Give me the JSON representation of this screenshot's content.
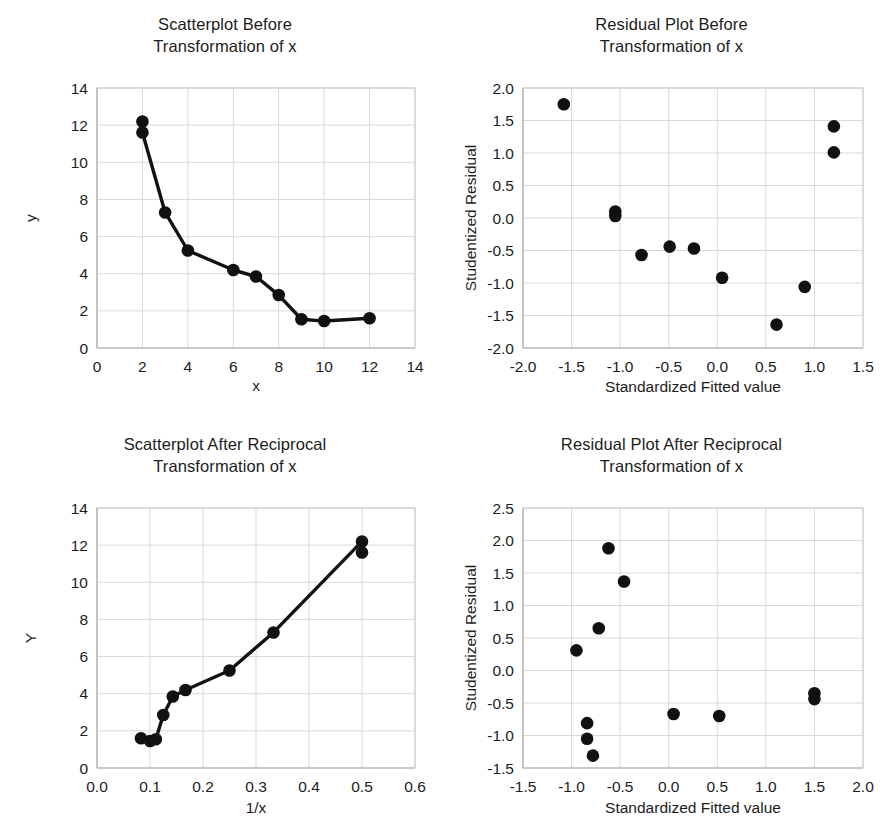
{
  "figure": {
    "panel_count": 4,
    "background": "#ffffff",
    "marker_color": "#111111",
    "gridline_color": "#d9d9d9"
  },
  "chart_data": [
    {
      "id": "scatterplot-before",
      "type": "line",
      "title": "Scatterplot Before Transformation of x",
      "title_line1": "Scatterplot Before",
      "title_line2": "Transformation of x",
      "xlabel": "x",
      "ylabel": "y",
      "xlim": [
        0,
        14
      ],
      "ylim": [
        0,
        14
      ],
      "xticks": [
        0,
        2,
        4,
        6,
        8,
        10,
        12,
        14
      ],
      "yticks": [
        0,
        2,
        4,
        6,
        8,
        10,
        12,
        14
      ],
      "xticklabels": [
        "0",
        "2",
        "4",
        "6",
        "8",
        "10",
        "12",
        "14"
      ],
      "yticklabels": [
        "0",
        "2",
        "4",
        "6",
        "8",
        "10",
        "12",
        "14"
      ],
      "grid": true,
      "legend": "none",
      "markers": true,
      "connected": true,
      "x": [
        2.0,
        2.0,
        3.0,
        4.0,
        6.0,
        7.0,
        8.0,
        9.0,
        10.0,
        12.0
      ],
      "y": [
        12.2,
        11.6,
        7.3,
        5.25,
        4.2,
        3.85,
        2.85,
        1.55,
        1.45,
        1.6
      ]
    },
    {
      "id": "residual-plot-before",
      "type": "scatter",
      "title": "Residual Plot Before Transformation of x",
      "title_line1": "Residual Plot Before",
      "title_line2": "Transformation of x",
      "xlabel": "Standardized Fitted value",
      "ylabel": "Studentized Residual",
      "xlim": [
        -2.0,
        1.5
      ],
      "ylim": [
        -2.0,
        2.0
      ],
      "xticks": [
        -2.0,
        -1.5,
        -1.0,
        -0.5,
        0.0,
        0.5,
        1.0,
        1.5
      ],
      "yticks": [
        -2.0,
        -1.5,
        -1.0,
        -0.5,
        0.0,
        0.5,
        1.0,
        1.5,
        2.0
      ],
      "xticklabels": [
        "-2.0",
        "-1.5",
        "-1.0",
        "-0.5",
        "0.0",
        "0.5",
        "1.0",
        "1.5"
      ],
      "yticklabels": [
        "-2.0",
        "-1.5",
        "-1.0",
        "-0.5",
        "0.0",
        "0.5",
        "1.0",
        "1.5",
        "2.0"
      ],
      "grid": true,
      "legend": "none",
      "markers": true,
      "connected": false,
      "x": [
        -1.58,
        -1.05,
        -1.05,
        -0.78,
        -0.49,
        -0.24,
        0.05,
        0.61,
        0.9,
        1.2,
        1.2
      ],
      "y": [
        1.75,
        0.1,
        0.03,
        -0.57,
        -0.44,
        -0.47,
        -0.92,
        -1.64,
        -1.06,
        1.41,
        1.01
      ]
    },
    {
      "id": "scatterplot-after",
      "type": "line",
      "title": "Scatterplot After Reciprocal Transformation of x",
      "title_line1": "Scatterplot After Reciprocal",
      "title_line2": "Transformation of x",
      "xlabel": "1/x",
      "ylabel": "Y",
      "xlim": [
        0.0,
        0.6
      ],
      "ylim": [
        0,
        14
      ],
      "xticks": [
        0.0,
        0.1,
        0.2,
        0.3,
        0.4,
        0.5,
        0.6
      ],
      "yticks": [
        0,
        2,
        4,
        6,
        8,
        10,
        12,
        14
      ],
      "xticklabels": [
        "0.0",
        "0.1",
        "0.2",
        "0.3",
        "0.4",
        "0.5",
        "0.6"
      ],
      "yticklabels": [
        "0",
        "2",
        "4",
        "6",
        "8",
        "10",
        "12",
        "14"
      ],
      "grid": true,
      "legend": "none",
      "markers": true,
      "connected": true,
      "x": [
        0.083,
        0.1,
        0.111,
        0.125,
        0.143,
        0.167,
        0.25,
        0.333,
        0.5,
        0.5
      ],
      "y": [
        1.6,
        1.45,
        1.55,
        2.85,
        3.85,
        4.2,
        5.25,
        7.3,
        12.2,
        11.6
      ]
    },
    {
      "id": "residual-plot-after",
      "type": "scatter",
      "title": "Residual Plot After Reciprocal Transformation of x",
      "title_line1": "Residual Plot After Reciprocal",
      "title_line2": "Transformation of x",
      "xlabel": "Standardized Fitted value",
      "ylabel": "Studentized Residual",
      "xlim": [
        -1.5,
        2.0
      ],
      "ylim": [
        -1.5,
        2.5
      ],
      "xticks": [
        -1.5,
        -1.0,
        -0.5,
        0.0,
        0.5,
        1.0,
        1.5,
        2.0
      ],
      "yticks": [
        -1.5,
        -1.0,
        -0.5,
        0.0,
        0.5,
        1.0,
        1.5,
        2.0,
        2.5
      ],
      "xticklabels": [
        "-1.5",
        "-1.0",
        "-0.5",
        "0.0",
        "0.5",
        "1.0",
        "1.5",
        "2.0"
      ],
      "yticklabels": [
        "-1.5",
        "-1.0",
        "-0.5",
        "0.0",
        "0.5",
        "1.0",
        "1.5",
        "2.0",
        "2.5"
      ],
      "grid": true,
      "legend": "none",
      "markers": true,
      "connected": false,
      "x": [
        -0.95,
        -0.84,
        -0.84,
        -0.78,
        -0.72,
        -0.62,
        -0.46,
        0.05,
        0.52,
        1.5,
        1.5
      ],
      "y": [
        0.31,
        -0.81,
        -1.05,
        -1.31,
        0.65,
        1.88,
        1.37,
        -0.67,
        -0.7,
        -0.35,
        -0.44
      ]
    }
  ]
}
